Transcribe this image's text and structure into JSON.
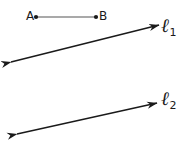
{
  "figure": {
    "type": "geometry-diagram",
    "width": 190,
    "height": 155,
    "background_color": "#ffffff",
    "stroke_color": "#1a1a1a",
    "segment_color": "#555555",
    "points": [
      {
        "name": "A",
        "label": "A",
        "x": 36,
        "y": 17,
        "dot_radius": 2.1
      },
      {
        "name": "B",
        "label": "B",
        "x": 96,
        "y": 17,
        "dot_radius": 2.1
      }
    ],
    "segments": [
      {
        "name": "segment-AB",
        "from": "A",
        "to": "B",
        "x1": 36,
        "y1": 17,
        "x2": 96,
        "y2": 17,
        "stroke_width": 1.2,
        "color": "#555555"
      }
    ],
    "lines": [
      {
        "name": "line-l1",
        "label": "ℓ",
        "subscript": "1",
        "x1": 11,
        "y1": 62,
        "x2": 159,
        "y2": 25,
        "arrow_start": true,
        "arrow_end": true,
        "stroke_width": 1.4,
        "color": "#1a1a1a"
      },
      {
        "name": "line-l2",
        "label": "ℓ",
        "subscript": "2",
        "x1": 17,
        "y1": 134,
        "x2": 157,
        "y2": 103,
        "arrow_start": true,
        "arrow_end": true,
        "stroke_width": 1.4,
        "color": "#1a1a1a"
      }
    ]
  }
}
